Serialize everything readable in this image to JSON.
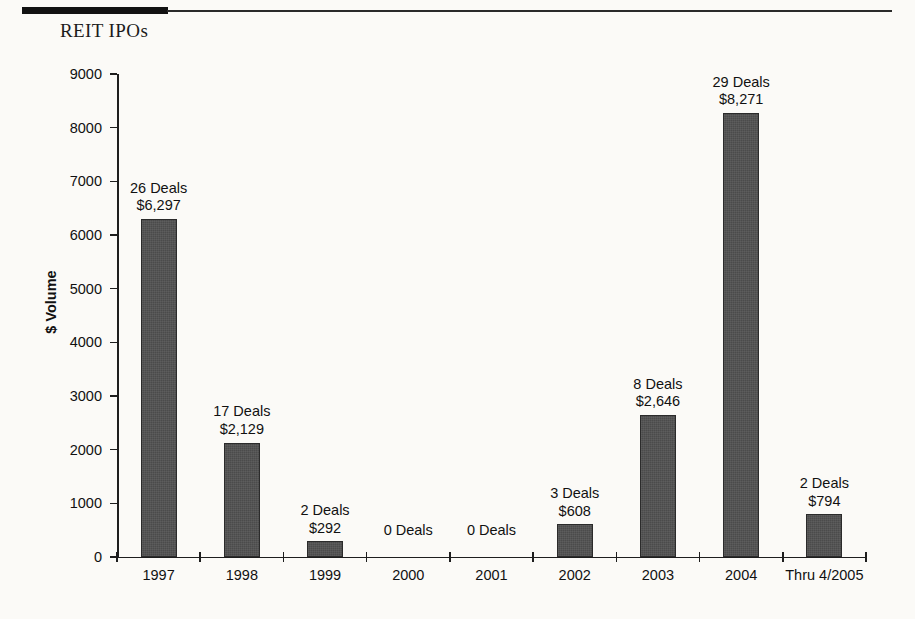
{
  "title": "REIT IPOs",
  "chart_data": {
    "type": "bar",
    "title": "REIT IPOs",
    "xlabel": "",
    "ylabel": "$ Volume",
    "ylim": [
      0,
      9000
    ],
    "grid": false,
    "legend": "none",
    "categories": [
      "1997",
      "1998",
      "1999",
      "2000",
      "2001",
      "2002",
      "2003",
      "2004",
      "Thru 4/2005"
    ],
    "values": [
      6297,
      2129,
      292,
      0,
      0,
      608,
      2646,
      8271,
      794
    ],
    "deals": [
      26,
      17,
      2,
      0,
      0,
      3,
      8,
      29,
      2
    ],
    "y_ticks": [
      0,
      1000,
      2000,
      3000,
      4000,
      5000,
      6000,
      7000,
      8000,
      9000
    ],
    "y_tick_labels": [
      "0",
      "1000",
      "2000",
      "3000",
      "4000",
      "5000",
      "6000",
      "7000",
      "8000",
      "9000"
    ],
    "point_labels": [
      {
        "deals": "26 Deals",
        "amount": "$6,297"
      },
      {
        "deals": "17 Deals",
        "amount": "$2,129"
      },
      {
        "deals": "2 Deals",
        "amount": "$292"
      },
      {
        "deals": "0 Deals",
        "amount": ""
      },
      {
        "deals": "0 Deals",
        "amount": ""
      },
      {
        "deals": "3 Deals",
        "amount": "$608"
      },
      {
        "deals": "8 Deals",
        "amount": "$2,646"
      },
      {
        "deals": "29 Deals",
        "amount": "$8,271"
      },
      {
        "deals": "2 Deals",
        "amount": "$794"
      }
    ],
    "colors": {
      "bar_fill": "#4b4b4b",
      "bar_stroke": "#2b2b2b",
      "axis": "#1e1e1e",
      "text": "#111111",
      "background": "#fbfaf7"
    }
  }
}
